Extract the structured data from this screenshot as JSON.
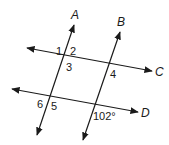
{
  "diagram": {
    "lines": {
      "A": {
        "label": "A"
      },
      "B": {
        "label": "B"
      },
      "C": {
        "label": "C"
      },
      "D": {
        "label": "D"
      }
    },
    "angles": {
      "a1": "1",
      "a2": "2",
      "a3": "3",
      "a4": "4",
      "a5": "5",
      "a6": "6",
      "given": "102°"
    },
    "colors": {
      "stroke": "#1a1a1a",
      "background": "#ffffff"
    }
  }
}
